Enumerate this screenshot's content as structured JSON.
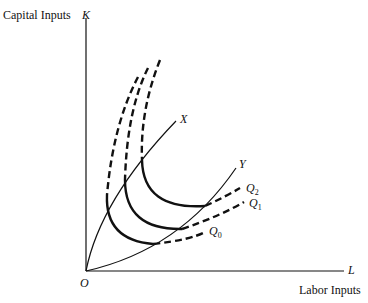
{
  "labels": {
    "y_axis_title": "Capital Inputs",
    "y_axis_symbol": "K",
    "x_axis_title": "Labor Inputs",
    "x_axis_symbol": "L",
    "origin": "O",
    "ridge_upper": "X",
    "ridge_lower": "Y",
    "q0": {
      "main": "Q",
      "sub": "0"
    },
    "q1": {
      "main": "Q",
      "sub": "1"
    },
    "q2": {
      "main": "Q",
      "sub": "2"
    }
  },
  "colors": {
    "ink": "#111111",
    "background": "#ffffff"
  }
}
